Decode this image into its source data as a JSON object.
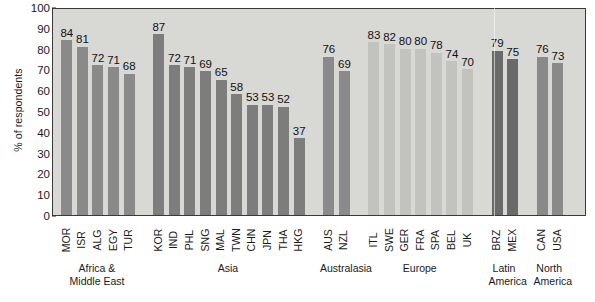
{
  "chart_data": {
    "type": "bar",
    "title": "",
    "xlabel": "",
    "ylabel": "% of respondents",
    "ylim": [
      0,
      100
    ],
    "ytick_values": [
      0,
      10,
      20,
      30,
      40,
      50,
      60,
      70,
      80,
      90,
      100
    ],
    "ytick_labels": [
      "0",
      "10",
      "20",
      "30",
      "40",
      "50",
      "60",
      "70",
      "80",
      "90",
      "100"
    ],
    "grid": false,
    "legend": "none",
    "bar_value_labels": true,
    "categories": [
      "MOR",
      "ISR",
      "ALG",
      "EGY",
      "TUR",
      "KOR",
      "IND",
      "PHL",
      "SNG",
      "MAL",
      "TWN",
      "CHN",
      "JPN",
      "THA",
      "HKG",
      "AUS",
      "NZL",
      "ITL",
      "SWE",
      "GER",
      "FRA",
      "SPA",
      "BEL",
      "UK",
      "BRZ",
      "MEX",
      "CAN",
      "USA"
    ],
    "values": [
      84,
      81,
      72,
      71,
      68,
      87,
      72,
      71,
      69,
      65,
      58,
      53,
      53,
      52,
      37,
      76,
      69,
      83,
      82,
      80,
      80,
      78,
      74,
      70,
      79,
      75,
      76,
      73
    ],
    "groups": [
      {
        "name": "Africa &\nMiddle East",
        "color": "#8a8a8a",
        "bars": [
          {
            "label": "MOR",
            "value": 84
          },
          {
            "label": "ISR",
            "value": 81
          },
          {
            "label": "ALG",
            "value": 72
          },
          {
            "label": "EGY",
            "value": 71
          },
          {
            "label": "TUR",
            "value": 68
          }
        ]
      },
      {
        "name": "Asia",
        "color": "#7d7d7d",
        "bars": [
          {
            "label": "KOR",
            "value": 87
          },
          {
            "label": "IND",
            "value": 72
          },
          {
            "label": "PHL",
            "value": 71
          },
          {
            "label": "SNG",
            "value": 69
          },
          {
            "label": "MAL",
            "value": 65
          },
          {
            "label": "TWN",
            "value": 58
          },
          {
            "label": "CHN",
            "value": 53
          },
          {
            "label": "JPN",
            "value": 53
          },
          {
            "label": "THA",
            "value": 52
          },
          {
            "label": "HKG",
            "value": 37
          }
        ]
      },
      {
        "name": "Australasia",
        "color": "#8a8a8a",
        "bars": [
          {
            "label": "AUS",
            "value": 76
          },
          {
            "label": "NZL",
            "value": 69
          }
        ]
      },
      {
        "name": "Europe",
        "color": "#c2c2bf",
        "bars": [
          {
            "label": "ITL",
            "value": 83
          },
          {
            "label": "SWE",
            "value": 82
          },
          {
            "label": "GER",
            "value": 80
          },
          {
            "label": "FRA",
            "value": 80
          },
          {
            "label": "SPA",
            "value": 78
          },
          {
            "label": "BEL",
            "value": 74
          },
          {
            "label": "UK",
            "value": 70
          }
        ]
      },
      {
        "name": "Latin\nAmerica",
        "color": "#6a6a6a",
        "bars": [
          {
            "label": "BRZ",
            "value": 79
          },
          {
            "label": "MEX",
            "value": 75
          }
        ]
      },
      {
        "name": "North\nAmerica",
        "color": "#8a8a8a",
        "bars": [
          {
            "label": "CAN",
            "value": 76
          },
          {
            "label": "USA",
            "value": 73
          }
        ]
      }
    ]
  },
  "source_note": ""
}
